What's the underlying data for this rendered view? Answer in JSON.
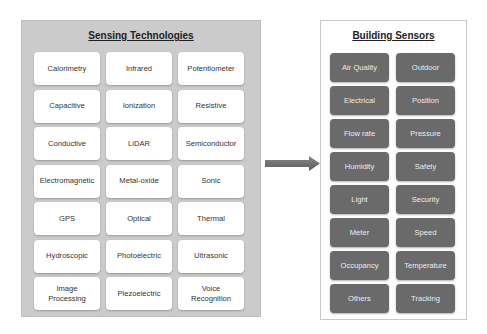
{
  "sensing_technologies": {
    "title": "Sensing Technologies",
    "items": [
      "Calorimetry",
      "Infrared",
      "Potentiometer",
      "Capacitive",
      "Ionization",
      "Resistive",
      "Conductive",
      "LiDAR",
      "Semiconductor",
      "Electromagnetic",
      "Metal-oxide",
      "Sonic",
      "GPS",
      "Optical",
      "Thermal",
      "Hydroscopic",
      "Photoelectric",
      "Ultrasonic",
      "Image Processing",
      "Piezoelectric",
      "Voice Recognition"
    ]
  },
  "arrow": {
    "icon": "right-arrow-icon",
    "color": "#6b6b6b"
  },
  "building_sensors": {
    "title": "Building Sensors",
    "items": [
      "Air Quality",
      "Outdoor",
      "Electrical",
      "Position",
      "Flow rate",
      "Pressure",
      "Humidity",
      "Safety",
      "Light",
      "Security",
      "Meter",
      "Speed",
      "Occupancy",
      "Temperature",
      "Others",
      "Tracking"
    ]
  },
  "colors": {
    "left_panel_bg": "#cbcbcb",
    "tech_tile_bg": "#ffffff",
    "sensor_tile_bg": "#6a6a6a",
    "sensor_text": "#ececec"
  }
}
